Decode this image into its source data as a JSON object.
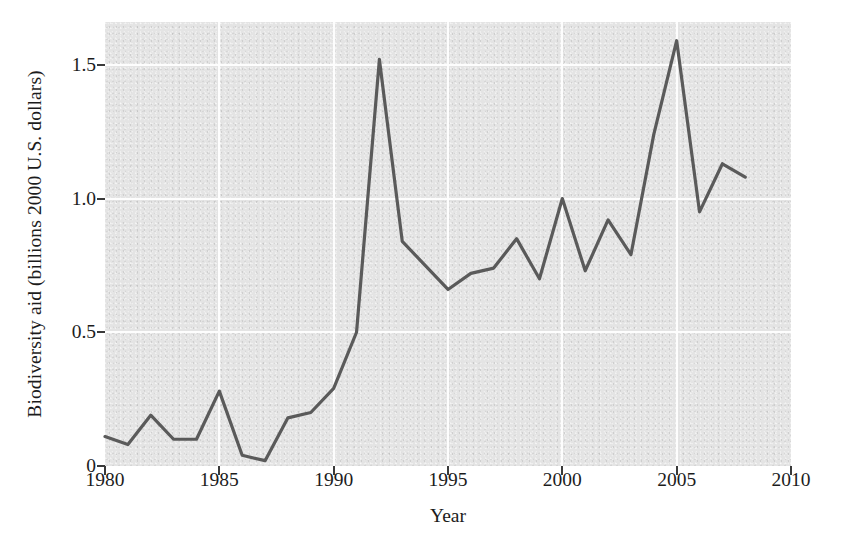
{
  "chart_data": {
    "type": "line",
    "title": "",
    "xlabel": "Year",
    "ylabel": "Biodiversity aid (billions 2000 U.S. dollars)",
    "xlim": [
      1980,
      2010
    ],
    "ylim": [
      0,
      1.66
    ],
    "grid": true,
    "legend": "none",
    "x_ticks": [
      "1980",
      "1985",
      "1990",
      "1995",
      "2000",
      "2005",
      "2010"
    ],
    "x_tick_values": [
      1980,
      1985,
      1990,
      1995,
      2000,
      2005,
      2010
    ],
    "y_ticks": [
      "0",
      "0.5",
      "1.0",
      "1.5"
    ],
    "y_tick_values": [
      0,
      0.5,
      1.0,
      1.5
    ],
    "x": [
      1980,
      1981,
      1982,
      1983,
      1984,
      1985,
      1986,
      1987,
      1988,
      1989,
      1990,
      1991,
      1992,
      1993,
      1994,
      1995,
      1996,
      1997,
      1998,
      1999,
      2000,
      2001,
      2002,
      2003,
      2004,
      2005,
      2006,
      2007,
      2008
    ],
    "series": [
      {
        "name": "Biodiversity aid",
        "color": "#5a5a5a",
        "values": [
          0.11,
          0.08,
          0.19,
          0.1,
          0.1,
          0.28,
          0.04,
          0.02,
          0.18,
          0.2,
          0.29,
          0.5,
          1.52,
          0.84,
          0.75,
          0.66,
          0.72,
          0.74,
          0.85,
          0.7,
          1.0,
          0.73,
          0.92,
          0.79,
          1.24,
          1.59,
          0.95,
          1.13,
          1.08
        ]
      }
    ],
    "annotations": []
  },
  "figure": {
    "background_color": "#ffffff",
    "plot_background_color": "#e4e4e4",
    "axis_color": "#3a3a3a",
    "gridline_color": "#fdfdfd",
    "line_color": "#5a5a5a"
  }
}
